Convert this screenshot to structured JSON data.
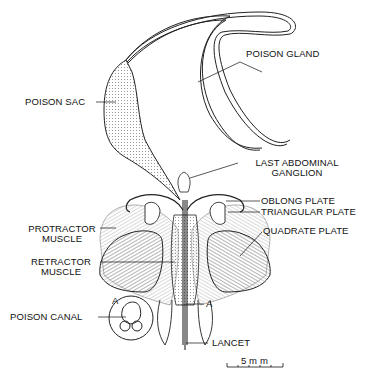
{
  "diagram": {
    "labels": {
      "poison_sac": "POISON SAC",
      "poison_gland": "POISON GLAND",
      "last_abdominal_ganglion_1": "LAST ABDOMINAL",
      "last_abdominal_ganglion_2": "GANGLION",
      "oblong_plate": "OBLONG PLATE",
      "triangular_plate": "TRIANGULAR PLATE",
      "quadrate_plate": "QUADRATE PLATE",
      "protractor_muscle_1": "PROTRACTOR",
      "protractor_muscle_2": "MUSCLE",
      "retractor_muscle_1": "RETRACTOR",
      "retractor_muscle_2": "MUSCLE",
      "poison_canal": "POISON CANAL",
      "section_marker": "A",
      "inset_marker": "A",
      "lancet": "LANCET"
    },
    "scale_bar": {
      "label": "5 m m"
    },
    "colors": {
      "ink": "#111111",
      "background": "#ffffff",
      "hatch": "#555555"
    }
  }
}
